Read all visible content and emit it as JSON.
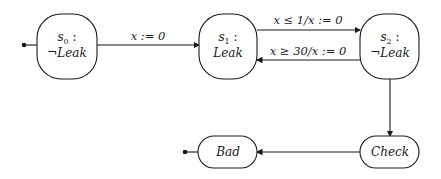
{
  "diagram": {
    "type": "state-machine",
    "states": [
      {
        "id": "s0",
        "name": "s",
        "sub": "0",
        "suffix": " :",
        "prop": "¬Leak"
      },
      {
        "id": "s1",
        "name": "s",
        "sub": "1",
        "suffix": " :",
        "prop": "Leak"
      },
      {
        "id": "s2",
        "name": "s",
        "sub": "2",
        "suffix": " :",
        "prop": "¬Leak"
      },
      {
        "id": "check",
        "label": "Check"
      },
      {
        "id": "bad",
        "label": "Bad"
      }
    ],
    "transitions": [
      {
        "from": "s0",
        "to": "s1",
        "label": "x := 0"
      },
      {
        "from": "s1",
        "to": "s2",
        "label": "x ≤ 1/x := 0"
      },
      {
        "from": "s2",
        "to": "s1",
        "label": "x ≥ 30/x := 0"
      },
      {
        "from": "s2",
        "to": "check",
        "label": ""
      },
      {
        "from": "check",
        "to": "bad",
        "label": ""
      }
    ],
    "initial_markers": [
      "s0",
      "bad"
    ]
  }
}
